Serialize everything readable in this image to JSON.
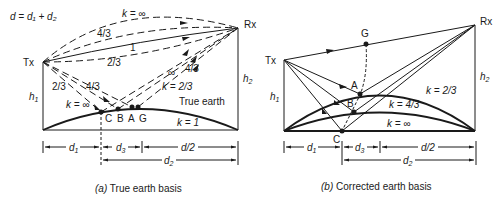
{
  "panel_a": {
    "equation": "d = d₁ + d₂",
    "tx_label": "Tx",
    "rx_label": "Rx",
    "h1_label": "h",
    "h1_sub": "1",
    "h2_label": "h",
    "h2_sub": "2",
    "ray_labels": {
      "k_inf_top": "k = ∞",
      "r43_top": "4/3",
      "r1": "1",
      "r23_top": "2/3",
      "r23_down": "2/3",
      "r43_down": "4/3",
      "inf_up": "∞",
      "r43_up": "4/3",
      "k23_up": "k = 2/3",
      "k_inf_down": "k = ∞"
    },
    "earth_label": "True earth",
    "k1_label": "k = 1",
    "points": [
      "C",
      "B",
      "A",
      "G"
    ],
    "dims": {
      "d1": "d",
      "d1_sub": "1",
      "d3": "d",
      "d3_sub": "3",
      "half": "d/2",
      "d2": "d",
      "d2_sub": "2"
    },
    "caption_prefix": "(a)",
    "caption": " True earth basis"
  },
  "panel_b": {
    "tx_label": "Tx",
    "rx_label": "Rx",
    "g_label": "G",
    "a_label": "A",
    "b_label": "B",
    "c_label": "C",
    "h1_label": "h",
    "h1_sub": "1",
    "h2_label": "h",
    "h2_sub": "2",
    "k23": "k = 2/3",
    "k43": "k = 4/3",
    "kinf": "k = ∞",
    "dims": {
      "d1": "d",
      "d1_sub": "1",
      "d3": "d",
      "d3_sub": "3",
      "half": "d/2",
      "d2": "d",
      "d2_sub": "2"
    },
    "caption_prefix": "(b)",
    "caption": " Corrected earth basis"
  }
}
